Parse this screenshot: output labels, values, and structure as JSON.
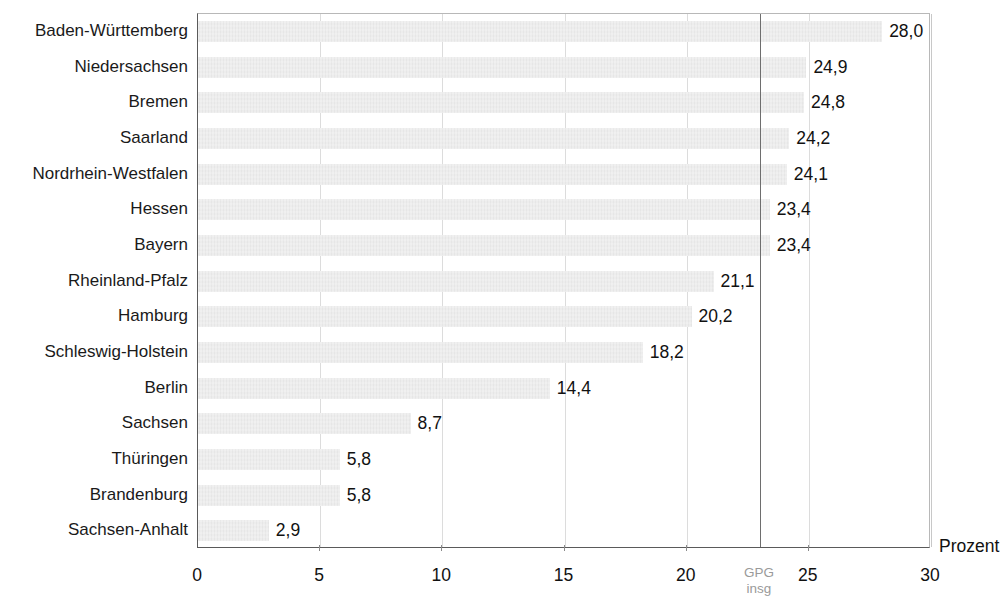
{
  "chart_data": {
    "type": "bar",
    "orientation": "horizontal",
    "title": "",
    "xlabel": "Prozent",
    "ylabel": "",
    "xlim": [
      0,
      30
    ],
    "xticks": [
      0,
      5,
      10,
      15,
      20,
      25,
      30
    ],
    "xtick_labels": [
      "0",
      "5",
      "10",
      "15",
      "20",
      "25",
      "30"
    ],
    "grid": true,
    "legend": null,
    "categories": [
      "Baden-Württemberg",
      "Niedersachsen",
      "Bremen",
      "Saarland",
      "Nordrhein-Westfalen",
      "Hessen",
      "Bayern",
      "Rheinland-Pfalz",
      "Hamburg",
      "Schleswig-Holstein",
      "Berlin",
      "Sachsen",
      "Thüringen",
      "Brandenburg",
      "Sachsen-Anhalt"
    ],
    "values": [
      28.0,
      24.9,
      24.8,
      24.2,
      24.1,
      23.4,
      23.4,
      21.1,
      20.2,
      18.2,
      14.4,
      8.7,
      5.8,
      5.8,
      2.9
    ],
    "value_labels": [
      "28,0",
      "24,9",
      "24,8",
      "24,2",
      "24,1",
      "23,4",
      "23,4",
      "21,1",
      "20,2",
      "18,2",
      "14,4",
      "8,7",
      "5,8",
      "5,8",
      "2,9"
    ],
    "reference_line": {
      "value": 23.0,
      "label_line1": "GPG",
      "label_line2": "insg",
      "color": "#6e6e6e"
    },
    "colors": {
      "bar": "#e6e6e6",
      "axis": "#5a5a5a",
      "grid": "#dcdcdc",
      "text": "#111111",
      "reference_label": "#9a9a9a"
    }
  }
}
